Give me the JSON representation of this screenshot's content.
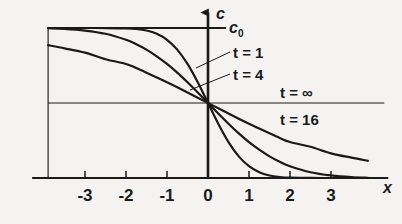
{
  "figure": {
    "background_color": "#f4f3f1",
    "ink_color": "#1a1a1a",
    "axis_labels": {
      "x": "x",
      "y": "c"
    },
    "level_label": "c",
    "level_subscript": "0"
  },
  "chart_data": {
    "type": "line",
    "title": "",
    "subtitle": "",
    "xlabel": "x",
    "ylabel": "c",
    "xlim": [
      -3.9,
      4.3
    ],
    "ylim": [
      -1.0,
      1.18
    ],
    "grid": false,
    "legend_position": "inline-annotations",
    "xticks": [
      -3,
      -2,
      -1,
      0,
      1,
      2,
      3
    ],
    "xtick_labels": [
      "-3",
      "-2",
      "-1",
      "0",
      "1",
      "2",
      "3"
    ],
    "yticks": [
      1.0
    ],
    "ytick_labels": [
      "c0"
    ],
    "annotations": [
      {
        "text": "t = 1",
        "x": 0.75,
        "y": 0.7,
        "leader": true
      },
      {
        "text": "t = 4",
        "x": 0.75,
        "y": 0.46,
        "leader": true
      },
      {
        "text": "t = ∞",
        "x": 1.95,
        "y": 0.17,
        "leader": false
      },
      {
        "text": "t = 16",
        "x": 1.95,
        "y": -0.17,
        "leader": false
      },
      {
        "text": "c0",
        "x": 0.3,
        "y": 1.0,
        "leader": false
      }
    ],
    "series": [
      {
        "name": "t = 1",
        "label": "t = 1",
        "t": 1,
        "x": [
          -3.9,
          -3.5,
          -3.0,
          -2.5,
          -2.0,
          -1.75,
          -1.5,
          -1.25,
          -1.0,
          -0.75,
          -0.5,
          -0.25,
          0,
          0.25,
          0.5,
          0.75,
          1.0,
          1.25,
          1.5,
          1.75,
          2.0,
          2.5,
          3.0,
          3.5,
          3.9
        ],
        "y": [
          1.0,
          1.0,
          1.0,
          0.9996,
          0.9953,
          0.9866,
          0.9661,
          0.9229,
          0.8427,
          0.7112,
          0.5205,
          0.2763,
          0,
          -0.2763,
          -0.5205,
          -0.7112,
          -0.8427,
          -0.9229,
          -0.9661,
          -0.9866,
          -0.9953,
          -0.9996,
          -1.0,
          -1.0,
          -1.0
        ]
      },
      {
        "name": "t = 4",
        "label": "t = 4",
        "t": 4,
        "x": [
          -3.9,
          -3.5,
          -3.0,
          -2.5,
          -2.0,
          -1.75,
          -1.5,
          -1.25,
          -1.0,
          -0.75,
          -0.5,
          -0.25,
          0,
          0.25,
          0.5,
          0.75,
          1.0,
          1.25,
          1.5,
          1.75,
          2.0,
          2.5,
          3.0,
          3.5,
          3.9
        ],
        "y": [
          0.9968,
          0.9891,
          0.9661,
          0.9229,
          0.8427,
          0.7834,
          0.7112,
          0.622,
          0.5205,
          0.4047,
          0.2763,
          0.1403,
          0,
          -0.1403,
          -0.2763,
          -0.4047,
          -0.5205,
          -0.622,
          -0.7112,
          -0.7834,
          -0.8427,
          -0.9229,
          -0.9661,
          -0.9891,
          -0.9968
        ]
      },
      {
        "name": "t = 16",
        "label": "t = 16",
        "t": 16,
        "x": [
          -3.9,
          -3.5,
          -3.0,
          -2.5,
          -2.0,
          -1.75,
          -1.5,
          -1.25,
          -1.0,
          -0.75,
          -0.5,
          -0.25,
          0,
          0.25,
          0.5,
          0.75,
          1.0,
          1.25,
          1.5,
          1.75,
          2.0,
          2.5,
          3.0,
          3.5,
          3.9
        ],
        "y": [
          0.7707,
          0.7291,
          0.6716,
          0.5841,
          0.5205,
          0.4657,
          0.4047,
          0.3413,
          0.2763,
          0.2089,
          0.1403,
          0.0705,
          0,
          -0.0705,
          -0.1403,
          -0.2089,
          -0.2763,
          -0.3413,
          -0.4047,
          -0.4657,
          -0.5205,
          -0.5841,
          -0.6716,
          -0.7291,
          -0.7707
        ]
      },
      {
        "name": "t = ∞",
        "label": "t = ∞",
        "t": "infinity",
        "x": [
          -3.9,
          4.3
        ],
        "y": [
          0,
          0
        ]
      }
    ],
    "reference_lines": [
      {
        "name": "c0-plateau",
        "orientation": "horizontal",
        "y": 1.0,
        "x_from": -3.9,
        "x_to": 0.35
      },
      {
        "name": "left-boundary",
        "orientation": "vertical",
        "x": -3.9,
        "y_from": -1.0,
        "y_to": 1.0
      },
      {
        "name": "t-infinity-line",
        "orientation": "horizontal",
        "y": 0,
        "x_from": -3.9,
        "x_to": 4.3
      }
    ]
  }
}
